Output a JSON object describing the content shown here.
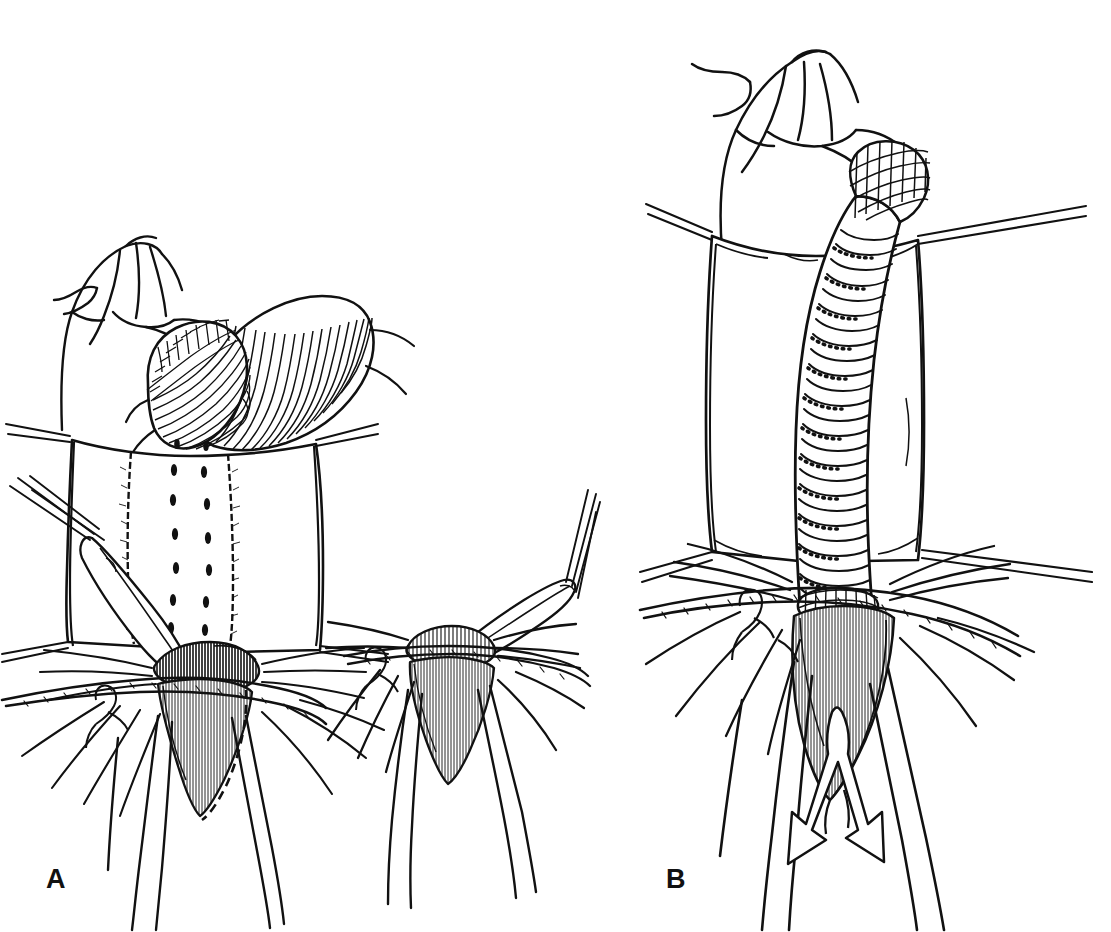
{
  "figure": {
    "kind": "scientific-line-drawing",
    "background_color": "#ffffff",
    "ink_color": "#111111",
    "width": 1111,
    "height": 932,
    "caption_text": "",
    "panels": [
      {
        "id": "A",
        "label": "A",
        "label_x": 46,
        "label_y": 866,
        "description": "Ventral view of terminal abdominal segments with the annulated tubular organ folded and looped to the right; a spatulate accessory sclerite with long setae lies at the left; a separate enlarged inset of the same genital region appears at lower right of the panel.",
        "subjects": [
          "clawed-appendage",
          "annulated-tube-looped",
          "abdominal-plate-with-punctations",
          "spatulate-sclerite",
          "gonopore-cone",
          "setal-fringe",
          "inset-detail"
        ]
      },
      {
        "id": "B",
        "label": "B",
        "label_x": 666,
        "label_y": 866,
        "description": "Ventral view of the same region with the annulated tubular organ fully extended and directed anteriorly; a double-headed outline arrow below the gonopore cone indicates the direction of movement.",
        "subjects": [
          "clawed-appendage",
          "annulated-tube-extended",
          "scaled-tube-tip",
          "abdominal-plate",
          "gonopore-cone",
          "setal-fringe",
          "double-headed-arrow"
        ]
      }
    ],
    "annotations": [
      {
        "name": "movement-arrow",
        "panel": "B",
        "type": "double-headed-outline-arrow",
        "meaning": "direction of extension"
      }
    ]
  }
}
